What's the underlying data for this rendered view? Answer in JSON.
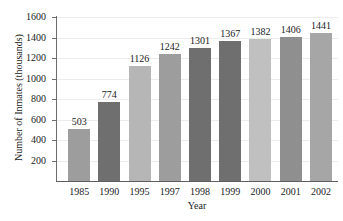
{
  "chart_data": {
    "type": "bar",
    "title": "and Federal Prisons",
    "xlabel": "Year",
    "ylabel": "Number of Inmates (thousands)",
    "categories": [
      "1985",
      "1990",
      "1995",
      "1997",
      "1998",
      "1999",
      "2000",
      "2001",
      "2002"
    ],
    "values": [
      503,
      774,
      1126,
      1242,
      1301,
      1367,
      1382,
      1406,
      1441
    ],
    "value_labels": [
      "503",
      "774",
      "1126",
      "1242",
      "1301",
      "1367",
      "1382",
      "1406",
      "1441"
    ],
    "bar_colors": [
      "#9d9d9d",
      "#6f6f6f",
      "#b6b6b6",
      "#9d9d9d",
      "#6f6f6f",
      "#6f6f6f",
      "#c0c0c0",
      "#8f8f8f",
      "#a6a6a6"
    ],
    "ylim": [
      0,
      1600
    ],
    "yticks": [
      200,
      400,
      600,
      800,
      1000,
      1200,
      1400,
      1600
    ],
    "ytick_labels": [
      "200",
      "400",
      "600",
      "800",
      "1000",
      "1200",
      "1400",
      "1600"
    ],
    "grid": true,
    "legend": null,
    "axis_color": "#6d6d6d",
    "grid_color": "#ececed",
    "text_color": "#1b1b1b"
  }
}
